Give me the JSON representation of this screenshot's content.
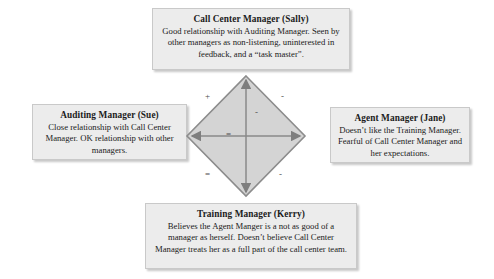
{
  "diagram": {
    "boxes": {
      "top": {
        "title": "Call Center Manager  (Sally)",
        "body": "Good relationship with Auditing Manager. Seen by other managers as non-listening, uninterested in feedback, and a “task master”."
      },
      "left": {
        "title": "Auditing Manager  (Sue)",
        "body": "Close relationship with Call Center Manager. OK relationship with other managers."
      },
      "right": {
        "title": "Agent Manager  (Jane)",
        "body": "Doesn’t like the Training Manager. Fearful of Call Center Manager and her expectations."
      },
      "bottom": {
        "title": "Training Manager  (Kerry)",
        "body": "Believes the Agent Manger is a not as good of a manager as herself. Doesn’t believe Call Center Manager treats her as a full part of the call center team."
      }
    },
    "signs": {
      "top_left_edge": "+",
      "top_right_edge": "-",
      "bottom_left_edge": "=",
      "bottom_right_edge": "-",
      "center_left": "=",
      "center_right": "-"
    },
    "colors": {
      "box_fill": "#ececec",
      "box_border": "#c9c9c9",
      "diamond_fill": "#d4d4d4",
      "diamond_edge": "#8c8c8c",
      "axis_line": "#8a8a8a",
      "text": "#1b1b1b"
    }
  }
}
